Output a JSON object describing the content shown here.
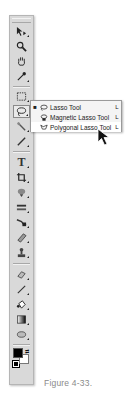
{
  "toolbar": {
    "tools": [
      {
        "name": "move-tool",
        "glyph": "➤",
        "has_flyout": true
      },
      {
        "name": "zoom-tool",
        "glyph": "🔍",
        "has_flyout": false
      },
      {
        "name": "hand-tool",
        "glyph": "✋",
        "has_flyout": false
      },
      {
        "name": "eyedropper-tool",
        "glyph": "✎",
        "has_flyout": true
      },
      {
        "name": "marquee-tool",
        "glyph": "⬚",
        "has_flyout": true
      },
      {
        "name": "lasso-tool",
        "glyph": "◌",
        "has_flyout": true,
        "active": true
      },
      {
        "name": "quick-selection-tool",
        "glyph": "✦",
        "has_flyout": true
      },
      {
        "name": "brush-tool",
        "glyph": "/",
        "has_flyout": true
      },
      {
        "name": "type-tool",
        "glyph": "T",
        "has_flyout": true
      },
      {
        "name": "crop-tool",
        "glyph": "⌗",
        "has_flyout": true
      },
      {
        "name": "spot-healing-tool",
        "glyph": "✚",
        "has_flyout": true
      },
      {
        "name": "history-brush-tool",
        "glyph": "≡",
        "has_flyout": true
      },
      {
        "name": "pen-tool",
        "glyph": "✒",
        "has_flyout": true
      },
      {
        "name": "path-selection-tool",
        "glyph": "◢",
        "has_flyout": true
      },
      {
        "name": "clone-stamp-tool",
        "glyph": "♙",
        "has_flyout": true
      },
      {
        "name": "eraser-tool",
        "glyph": "⌫",
        "has_flyout": true
      },
      {
        "name": "pencil-tool",
        "glyph": "✏",
        "has_flyout": true
      },
      {
        "name": "paint-bucket-tool",
        "glyph": "◆",
        "has_flyout": true
      },
      {
        "name": "gradient-tool",
        "glyph": "▮",
        "has_flyout": true
      },
      {
        "name": "shape-tool",
        "glyph": "⬭",
        "has_flyout": true
      },
      {
        "name": "blur-tool",
        "glyph": "💧",
        "has_flyout": true
      },
      {
        "name": "dodge-tool",
        "glyph": "●",
        "has_flyout": true
      }
    ],
    "foreground_color": "#000000",
    "background_color": "#ffffff"
  },
  "flyout": {
    "items": [
      {
        "label": "Lasso Tool",
        "shortcut": "L",
        "selected": true,
        "icon": "lasso-icon"
      },
      {
        "label": "Magnetic Lasso Tool",
        "shortcut": "L",
        "selected": false,
        "icon": "magnetic-lasso-icon"
      },
      {
        "label": "Polygonal Lasso Tool",
        "shortcut": "L",
        "selected": false,
        "highlighted": true,
        "icon": "polygonal-lasso-icon"
      }
    ],
    "bullet": "■"
  },
  "caption": "Figure 4-33."
}
